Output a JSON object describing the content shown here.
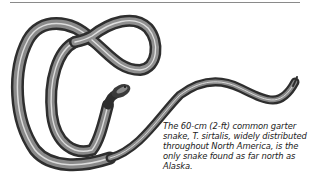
{
  "figure": {
    "illustration": "snake-illustration",
    "subject": "common garter snake",
    "caption": "The 60-cm (2-ft) common garter snake, T. sirtalis, widely distributed throughout North America, is the only snake found as far north as Alaska."
  },
  "colors": {
    "snake_dark": "#2a2a2a",
    "snake_mid": "#777777",
    "snake_stripe": "#d8d8d8",
    "rule": "#8a8a8a"
  }
}
